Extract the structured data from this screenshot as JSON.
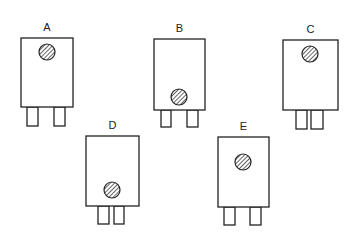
{
  "diagram": {
    "components": [
      {
        "label": "A",
        "box": {
          "x": 21,
          "y": 38,
          "w": 52,
          "h": 69
        },
        "dot": {
          "cx": 47,
          "cy": 52,
          "r": 8
        },
        "legs": [
          {
            "x": 27,
            "w": 11
          },
          {
            "x": 54,
            "w": 11
          }
        ],
        "leg_top": 107,
        "leg_h": 19
      },
      {
        "label": "B",
        "box": {
          "x": 154,
          "y": 39,
          "w": 51,
          "h": 71
        },
        "dot": {
          "cx": 179,
          "cy": 97,
          "r": 8
        },
        "legs": [
          {
            "x": 161,
            "w": 10
          },
          {
            "x": 187,
            "w": 11
          }
        ],
        "leg_top": 110,
        "leg_h": 17
      },
      {
        "label": "C",
        "box": {
          "x": 283,
          "y": 40,
          "w": 55,
          "h": 70
        },
        "dot": {
          "cx": 310,
          "cy": 54,
          "r": 8
        },
        "legs": [
          {
            "x": 296,
            "w": 11
          },
          {
            "x": 311,
            "w": 12
          }
        ],
        "leg_top": 110,
        "leg_h": 19
      },
      {
        "label": "D",
        "box": {
          "x": 86,
          "y": 136,
          "w": 53,
          "h": 70
        },
        "dot": {
          "cx": 112,
          "cy": 190,
          "r": 8
        },
        "legs": [
          {
            "x": 98,
            "w": 11
          },
          {
            "x": 114,
            "w": 10
          }
        ],
        "leg_top": 206,
        "leg_h": 18
      },
      {
        "label": "E",
        "box": {
          "x": 218,
          "y": 137,
          "w": 51,
          "h": 70
        },
        "dot": {
          "cx": 243,
          "cy": 162,
          "r": 8
        },
        "legs": [
          {
            "x": 224,
            "w": 11
          },
          {
            "x": 250,
            "w": 11
          }
        ],
        "leg_top": 207,
        "leg_h": 18
      }
    ],
    "colors": {
      "stroke": "#222222",
      "background": "#ffffff"
    }
  }
}
